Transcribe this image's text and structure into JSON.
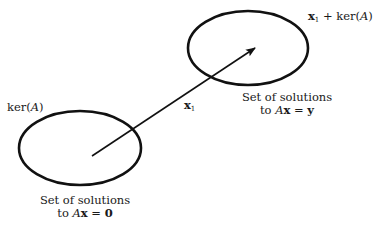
{
  "diagram": {
    "kernel_set": {
      "label": "ker(A)",
      "label_prefix": "ker(",
      "label_var": "A",
      "label_suffix": ")",
      "caption_line1": "Set of solutions",
      "caption_line2_prefix": "to ",
      "caption_line2_var": "A",
      "caption_line2_bold": "x",
      "caption_line2_eq": " = ",
      "caption_line2_rhs": "0"
    },
    "affine_set": {
      "label_vec": "x",
      "label_sub": "1",
      "label_plus": " + ",
      "label_ker_prefix": "ker(",
      "label_ker_var": "A",
      "label_ker_suffix": ")",
      "caption_line1": "Set of solutions",
      "caption_line2_prefix": "to ",
      "caption_line2_var": "A",
      "caption_line2_bold": "x",
      "caption_line2_eq": " = ",
      "caption_line2_rhs": "y"
    },
    "arrow": {
      "label_vec": "x",
      "label_sub": "1"
    },
    "colors": {
      "stroke": "#111111",
      "background": "#ffffff"
    }
  }
}
